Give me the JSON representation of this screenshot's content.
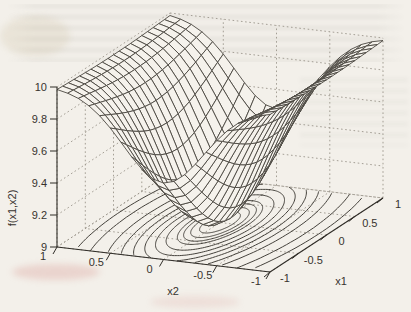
{
  "page": {
    "background_color": "#f3f0ea",
    "description_of_visual": "scanned 3d mesh surface plot with contour projection on floor"
  },
  "chart_data": {
    "type": "surface",
    "subtype": "3d-mesh-with-floor-contour",
    "title": "",
    "zlabel": "f(x1,x2)",
    "x1_axis_label": "x1",
    "x2_axis_label": "x2",
    "x1_range": [
      -1,
      1
    ],
    "x2_range": [
      -1,
      1
    ],
    "z_range": [
      9,
      10
    ],
    "x1_tick_labels": [
      "-1",
      "-0.5",
      "0",
      "0.5",
      "1"
    ],
    "x1_tick_values": [
      -1,
      -0.5,
      0,
      0.5,
      1
    ],
    "x2_tick_labels": [
      "1",
      "0.5",
      "0",
      "-0.5",
      "-1"
    ],
    "x2_tick_values": [
      1,
      0.5,
      0,
      -0.5,
      -1
    ],
    "z_tick_labels": [
      "10",
      "9.8",
      "9.6",
      "9.4",
      "9.2",
      "9"
    ],
    "z_tick_values": [
      10,
      9.8,
      9.6,
      9.4,
      9.2,
      9
    ],
    "surface_formula_js": "10 - Math.exp(-(0.65*x1*x1 + 3.5*x2*x2))",
    "surface_min_z": 9.0,
    "surface_corner_z": 9.98,
    "mesh_grid_lines": 21,
    "contour_levels": [
      9.05,
      9.1,
      9.15,
      9.2,
      9.3,
      9.4,
      9.5,
      9.6,
      9.7,
      9.8,
      9.9,
      9.95
    ],
    "grid_on": true,
    "colors": {
      "mesh_line": "#4a463f",
      "mesh_fill": "#f5f2ec",
      "contour_line": "#45423c",
      "axis_line": "#2f2c27",
      "grid_dotted": "#9b958b",
      "tick_text": "#37332e"
    }
  }
}
